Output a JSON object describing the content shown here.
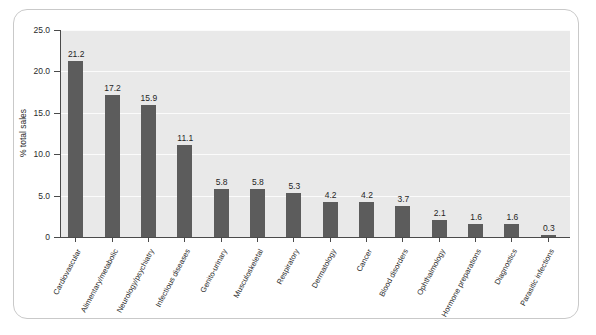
{
  "chart_data": {
    "type": "bar",
    "title": "",
    "xlabel": "",
    "ylabel": "% total sales",
    "ylim": [
      0,
      25
    ],
    "yticks": [
      "0",
      "5.0",
      "10.0",
      "15.0",
      "20.0",
      "25.0"
    ],
    "ytick_values": [
      0,
      5,
      10,
      15,
      20,
      25
    ],
    "grid": true,
    "legend": false,
    "bar_color": "#5c5c5c",
    "plot_background": "#e9e9e9",
    "categories": [
      "Cardiovascular",
      "Alimentary/metabolic",
      "Neurology/psychiatry",
      "Infectious diseases",
      "Genito-urinary",
      "Musculoskeletal",
      "Respiratory",
      "Dermatology",
      "Cancer",
      "Blood disorders",
      "Ophthalmology",
      "Hormone preparations",
      "Diagnostics",
      "Parasitic infections"
    ],
    "values": [
      21.2,
      17.2,
      15.9,
      11.1,
      5.8,
      5.8,
      5.3,
      4.2,
      4.2,
      3.7,
      2.1,
      1.6,
      1.6,
      0.3
    ],
    "value_labels": [
      "21.2",
      "17.2",
      "15.9",
      "11.1",
      "5.8",
      "5.8",
      "5.3",
      "4.2",
      "4.2",
      "3.7",
      "2.1",
      "1.6",
      "1.6",
      "0.3"
    ]
  }
}
